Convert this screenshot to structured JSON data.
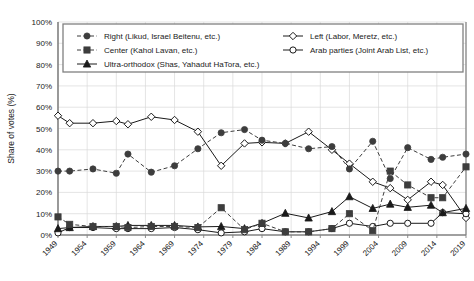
{
  "chart_data": {
    "type": "line",
    "title": "",
    "xlabel": "",
    "ylabel": "Share of votes (%)",
    "ylim": [
      0,
      100
    ],
    "xlim": [
      1949,
      2019
    ],
    "grid": true,
    "legend_position": "top-inside",
    "y_ticks": [
      "0%",
      "10%",
      "20%",
      "30%",
      "40%",
      "50%",
      "60%",
      "70%",
      "80%",
      "90%",
      "100%"
    ],
    "y_tick_values": [
      0,
      10,
      20,
      30,
      40,
      50,
      60,
      70,
      80,
      90,
      100
    ],
    "x_ticks": [
      "1949",
      "1954",
      "1959",
      "1964",
      "1969",
      "1974",
      "1979",
      "1984",
      "1989",
      "1994",
      "1999",
      "2004",
      "2009",
      "2014",
      "2019"
    ],
    "x_tick_values": [
      1949,
      1954,
      1959,
      1964,
      1969,
      1974,
      1979,
      1984,
      1989,
      1994,
      1999,
      2004,
      2009,
      2014,
      2019
    ],
    "x": [
      1949,
      1951,
      1955,
      1959,
      1961,
      1965,
      1969,
      1973,
      1977,
      1981,
      1984,
      1988,
      1992,
      1996,
      1999,
      2003,
      2006,
      2009,
      2013,
      2015,
      2019
    ],
    "series": [
      {
        "name": "Right (Likud, Israel Beitenu, etc.)",
        "key": "right",
        "marker": "filled-circle",
        "line_style": "dashed",
        "color": "#3d3d3d",
        "values": [
          30,
          30,
          31,
          29,
          38,
          29.5,
          32.5,
          40.5,
          48,
          49.5,
          44.5,
          43,
          40.5,
          41.5,
          31,
          44,
          26.5,
          41,
          35.5,
          36.5,
          38
        ]
      },
      {
        "name": "Center (Kahol Lavan, etc.)",
        "key": "center",
        "marker": "filled-square",
        "line_style": "dashed",
        "color": "#3d3d3d",
        "values": [
          8.5,
          5,
          4,
          4,
          3.5,
          4,
          4,
          3.5,
          12.8,
          2.5,
          5.5,
          1.5,
          1.5,
          3,
          10,
          2,
          30,
          23.5,
          17.5,
          17.5,
          32
        ]
      },
      {
        "name": "Ultra-orthodox (Shas, Yahadut HaTora, etc.)",
        "key": "ultra_orthodox",
        "marker": "filled-triangle",
        "line_style": "solid",
        "color": "#1a1a1a",
        "values": [
          3,
          3.5,
          4,
          4,
          4.5,
          4.5,
          4.5,
          3.8,
          4,
          3,
          5.5,
          10.2,
          8,
          11,
          18,
          12.5,
          14.5,
          13,
          14,
          10.5,
          12.5
        ]
      },
      {
        "name": "Left (Labor, Meretz, etc.)",
        "key": "left",
        "marker": "open-diamond",
        "line_style": "solid",
        "color": "#1a1a1a",
        "values": [
          56,
          52.5,
          52.5,
          53.5,
          52,
          55.5,
          54,
          48.5,
          32.5,
          43,
          43.5,
          43,
          48.5,
          40,
          33.5,
          25,
          22,
          16.5,
          25,
          23.5,
          8
        ]
      },
      {
        "name": "Arab parties (Joint Arab List, etc.)",
        "key": "arab",
        "marker": "open-circle",
        "line_style": "solid",
        "color": "#1a1a1a",
        "values": [
          1,
          3.5,
          3.5,
          3,
          3,
          3,
          3.5,
          2.5,
          1,
          1.5,
          3,
          1.5,
          1.5,
          3,
          5.5,
          4,
          5.5,
          5.5,
          5.5,
          10.5,
          10
        ]
      }
    ]
  },
  "legend": {
    "items": [
      {
        "label": "Right (Likud, Israel Beitenu, etc.)",
        "key": "right"
      },
      {
        "label": "Center (Kahol Lavan, etc.)",
        "key": "center"
      },
      {
        "label": "Ultra-orthodox (Shas, Yahadut HaTora, etc.)",
        "key": "ultra_orthodox"
      },
      {
        "label": "Left (Labor, Meretz, etc.)",
        "key": "left"
      },
      {
        "label": "Arab parties (Joint Arab List, etc.)",
        "key": "arab"
      }
    ]
  },
  "colors": {
    "axis": "#808080",
    "grid": "#d9d9d9",
    "text": "#1a1a1a",
    "marker_fill": "#3d3d3d",
    "marker_open": "#ffffff",
    "legend_border": "#808080"
  }
}
